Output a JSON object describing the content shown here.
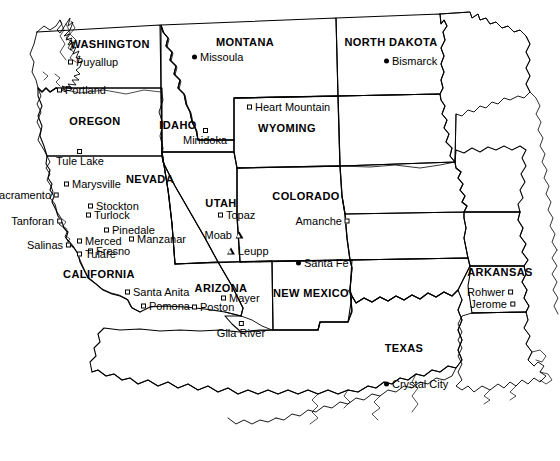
{
  "map": {
    "title": "Western United States map of World War II Japanese American assembly centers and relocation sites",
    "background_color": "#ffffff",
    "line_color": "#000000",
    "width": 560,
    "height": 461,
    "state_labels": [
      {
        "name": "WASHINGTON",
        "x": 110,
        "y": 44
      },
      {
        "name": "OREGON",
        "x": 95,
        "y": 121
      },
      {
        "name": "IDAHO",
        "x": 178,
        "y": 125
      },
      {
        "name": "MONTANA",
        "x": 245,
        "y": 42
      },
      {
        "name": "NORTH DAKOTA",
        "x": 391,
        "y": 42
      },
      {
        "name": "WYOMING",
        "x": 287,
        "y": 128
      },
      {
        "name": "NEVADA",
        "x": 150,
        "y": 179
      },
      {
        "name": "UTAH",
        "x": 221,
        "y": 203
      },
      {
        "name": "COLORADO",
        "x": 306,
        "y": 196
      },
      {
        "name": "CALIFORNIA",
        "x": 99,
        "y": 274
      },
      {
        "name": "ARIZONA",
        "x": 221,
        "y": 288
      },
      {
        "name": "NEW MEXICO",
        "x": 311,
        "y": 293
      },
      {
        "name": "TEXAS",
        "x": 404,
        "y": 348
      },
      {
        "name": "ARKANSAS",
        "x": 500,
        "y": 272
      }
    ],
    "places": [
      {
        "name": "Puyallup",
        "x": 68,
        "y": 62,
        "marker": "square",
        "label_side": "right"
      },
      {
        "name": "Portland",
        "x": 57,
        "y": 90,
        "marker": "square",
        "label_side": "right"
      },
      {
        "name": "Missoula",
        "x": 192,
        "y": 57,
        "marker": "circle",
        "label_side": "right"
      },
      {
        "name": "Bismarck",
        "x": 384,
        "y": 61,
        "marker": "circle",
        "label_side": "right"
      },
      {
        "name": "Heart Mountain",
        "x": 247,
        "y": 107,
        "marker": "square",
        "label_side": "right"
      },
      {
        "name": "Minidoka",
        "x": 205,
        "y": 137,
        "marker": "square",
        "label_side": "below"
      },
      {
        "name": "Tule Lake",
        "x": 80,
        "y": 158,
        "marker": "square",
        "label_side": "below"
      },
      {
        "name": "Marysville",
        "x": 64,
        "y": 184,
        "marker": "square",
        "label_side": "right"
      },
      {
        "name": "Sacramento",
        "x": 59,
        "y": 195,
        "marker": "square",
        "label_side": "left"
      },
      {
        "name": "Stockton",
        "x": 88,
        "y": 206,
        "marker": "square",
        "label_side": "right"
      },
      {
        "name": "Turlock",
        "x": 86,
        "y": 215,
        "marker": "square",
        "label_side": "right"
      },
      {
        "name": "Tanforan",
        "x": 62,
        "y": 221,
        "marker": "square",
        "label_side": "left"
      },
      {
        "name": "Pinedale",
        "x": 104,
        "y": 230,
        "marker": "square",
        "label_side": "right"
      },
      {
        "name": "Manzanar",
        "x": 129,
        "y": 239,
        "marker": "square",
        "label_side": "right"
      },
      {
        "name": "Merced",
        "x": 77,
        "y": 241,
        "marker": "square",
        "label_side": "right"
      },
      {
        "name": "Fresno",
        "x": 88,
        "y": 251,
        "marker": "square",
        "label_side": "right"
      },
      {
        "name": "Salinas",
        "x": 71,
        "y": 245,
        "marker": "square",
        "label_side": "left"
      },
      {
        "name": "Tulare",
        "x": 77,
        "y": 254,
        "marker": "square",
        "label_side": "right"
      },
      {
        "name": "Topaz",
        "x": 218,
        "y": 215,
        "marker": "square",
        "label_side": "right"
      },
      {
        "name": "Amanche",
        "x": 350,
        "y": 221,
        "marker": "square",
        "label_side": "left"
      },
      {
        "name": "Moab",
        "x": 243,
        "y": 235,
        "marker": "triangle",
        "label_side": "left"
      },
      {
        "name": "Leupp",
        "x": 227,
        "y": 251,
        "marker": "triangle",
        "label_side": "right"
      },
      {
        "name": "Santa Fe",
        "x": 296,
        "y": 263,
        "marker": "circle",
        "label_side": "right"
      },
      {
        "name": "Santa Anita",
        "x": 125,
        "y": 292,
        "marker": "square",
        "label_side": "right"
      },
      {
        "name": "Mayer",
        "x": 221,
        "y": 298,
        "marker": "square",
        "label_side": "right"
      },
      {
        "name": "Poston",
        "x": 192,
        "y": 307,
        "marker": "square",
        "label_side": "right"
      },
      {
        "name": "Pomona",
        "x": 141,
        "y": 306,
        "marker": "square",
        "label_side": "right"
      },
      {
        "name": "Rohwer",
        "x": 513,
        "y": 292,
        "marker": "square",
        "label_side": "left"
      },
      {
        "name": "Jerome",
        "x": 515,
        "y": 304,
        "marker": "square",
        "label_side": "left"
      },
      {
        "name": "Gila River",
        "x": 241,
        "y": 330,
        "marker": "square",
        "label_side": "below"
      },
      {
        "name": "Crystal City",
        "x": 384,
        "y": 384,
        "marker": "circle",
        "label_side": "right"
      }
    ]
  }
}
